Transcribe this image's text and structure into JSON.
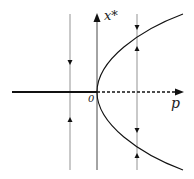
{
  "diagram": {
    "type": "bifurcation-diagram",
    "axes": {
      "vertical_label": "x*",
      "horizontal_label": "p",
      "origin_label": "0"
    },
    "branches": [
      {
        "name": "stable-negative-axis",
        "style": "solid-thick"
      },
      {
        "name": "unstable-positive-axis",
        "style": "dashed"
      },
      {
        "name": "stable-upper-parabola",
        "style": "solid"
      },
      {
        "name": "stable-lower-parabola",
        "style": "solid"
      }
    ],
    "flow_lines": [
      {
        "position": "p<0",
        "arrows": [
          "down-above-axis",
          "up-below-axis"
        ]
      },
      {
        "position": "p>0",
        "arrows": [
          "down-above-upper",
          "up-below-upper",
          "down-above-lower",
          "up-below-lower"
        ]
      }
    ],
    "colors": {
      "ink": "#1a1a1a",
      "thin": "#555555"
    }
  }
}
